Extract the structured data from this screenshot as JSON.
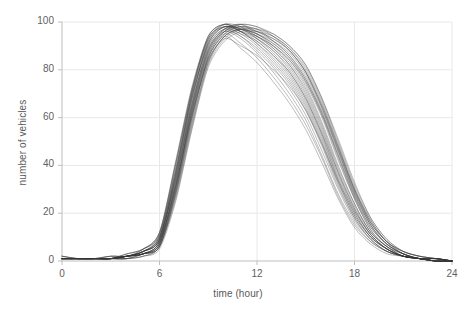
{
  "chart_data": {
    "type": "line",
    "title": "",
    "subtitle": "",
    "xlabel": "time (hour)",
    "ylabel": "number of vehicles",
    "xlim": [
      0,
      24
    ],
    "ylim": [
      0,
      100
    ],
    "xticks": [
      0,
      6,
      12,
      18,
      24
    ],
    "yticks": [
      0,
      20,
      40,
      60,
      80,
      100
    ],
    "xtick_labels": [
      "0",
      "6",
      "12",
      "18",
      "24"
    ],
    "ytick_labels": [
      "0",
      "20",
      "40",
      "60",
      "80",
      "100"
    ],
    "grid": true,
    "grid_color": "#e8e8e8",
    "axis_color": "#bfbfbf",
    "line_color": "#333333",
    "line_width": 0.6,
    "line_opacity": 0.55,
    "legend": null,
    "legend_position": "none",
    "annotations": [],
    "x": [
      0,
      1,
      2,
      3,
      4,
      5,
      6,
      7,
      8,
      9,
      10,
      11,
      12,
      13,
      14,
      15,
      16,
      17,
      18,
      19,
      20,
      21,
      22,
      23,
      24
    ],
    "series": [
      {
        "name": "day-01",
        "values": [
          1,
          1,
          1,
          1,
          2,
          3,
          7,
          33,
          64,
          88,
          97,
          99,
          96,
          93,
          88,
          79,
          64,
          46,
          28,
          15,
          7,
          3,
          1,
          1,
          0
        ]
      },
      {
        "name": "day-02",
        "values": [
          1,
          1,
          1,
          1,
          2,
          4,
          9,
          36,
          68,
          91,
          98,
          97,
          95,
          90,
          83,
          73,
          58,
          40,
          24,
          12,
          6,
          2,
          1,
          0,
          0
        ]
      },
      {
        "name": "day-03",
        "values": [
          1,
          1,
          1,
          1,
          1,
          3,
          6,
          29,
          60,
          85,
          95,
          98,
          97,
          94,
          89,
          80,
          66,
          48,
          30,
          16,
          8,
          3,
          1,
          1,
          0
        ]
      },
      {
        "name": "day-04",
        "values": [
          2,
          1,
          1,
          1,
          2,
          4,
          10,
          38,
          70,
          92,
          99,
          96,
          93,
          88,
          81,
          70,
          55,
          37,
          22,
          11,
          5,
          2,
          1,
          0,
          0
        ]
      },
      {
        "name": "day-05",
        "values": [
          1,
          1,
          1,
          1,
          2,
          3,
          8,
          31,
          62,
          86,
          96,
          99,
          98,
          95,
          90,
          82,
          68,
          50,
          32,
          18,
          9,
          4,
          2,
          1,
          0
        ]
      },
      {
        "name": "day-06",
        "values": [
          1,
          1,
          1,
          2,
          2,
          5,
          12,
          41,
          72,
          93,
          98,
          95,
          92,
          86,
          78,
          67,
          52,
          34,
          20,
          10,
          5,
          2,
          1,
          0,
          0
        ]
      },
      {
        "name": "day-07",
        "values": [
          1,
          1,
          1,
          1,
          1,
          2,
          6,
          27,
          57,
          83,
          94,
          97,
          96,
          93,
          88,
          79,
          65,
          47,
          29,
          15,
          7,
          3,
          1,
          1,
          0
        ]
      },
      {
        "name": "day-08",
        "values": [
          1,
          1,
          1,
          1,
          2,
          4,
          9,
          35,
          66,
          89,
          97,
          98,
          94,
          89,
          82,
          71,
          56,
          38,
          23,
          12,
          6,
          2,
          1,
          0,
          0
        ]
      },
      {
        "name": "day-09",
        "values": [
          1,
          1,
          1,
          1,
          2,
          3,
          7,
          30,
          61,
          84,
          93,
          90,
          86,
          80,
          73,
          63,
          49,
          33,
          19,
          10,
          5,
          2,
          1,
          0,
          0
        ]
      },
      {
        "name": "day-10",
        "values": [
          2,
          1,
          1,
          1,
          3,
          5,
          11,
          39,
          71,
          94,
          99,
          97,
          94,
          90,
          84,
          74,
          60,
          42,
          26,
          13,
          6,
          3,
          1,
          1,
          0
        ]
      },
      {
        "name": "day-11",
        "values": [
          1,
          1,
          1,
          1,
          2,
          3,
          8,
          32,
          63,
          87,
          96,
          94,
          88,
          81,
          72,
          61,
          46,
          30,
          17,
          9,
          4,
          2,
          1,
          0,
          0
        ]
      },
      {
        "name": "day-12",
        "values": [
          1,
          1,
          1,
          1,
          1,
          3,
          6,
          28,
          59,
          85,
          95,
          98,
          97,
          92,
          86,
          76,
          62,
          44,
          27,
          14,
          7,
          3,
          1,
          1,
          0
        ]
      },
      {
        "name": "day-13",
        "values": [
          1,
          1,
          1,
          2,
          2,
          4,
          10,
          37,
          69,
          91,
          98,
          96,
          91,
          84,
          76,
          65,
          50,
          33,
          19,
          10,
          5,
          2,
          1,
          0,
          0
        ]
      },
      {
        "name": "day-14",
        "values": [
          1,
          1,
          1,
          1,
          2,
          3,
          7,
          31,
          64,
          88,
          97,
          99,
          95,
          91,
          85,
          75,
          61,
          43,
          26,
          13,
          6,
          3,
          1,
          1,
          0
        ]
      },
      {
        "name": "day-15",
        "values": [
          1,
          1,
          1,
          1,
          2,
          4,
          9,
          34,
          65,
          90,
          97,
          95,
          90,
          83,
          75,
          64,
          49,
          32,
          18,
          9,
          4,
          2,
          1,
          0,
          0
        ]
      },
      {
        "name": "day-16",
        "values": [
          1,
          1,
          1,
          1,
          1,
          2,
          5,
          25,
          55,
          81,
          92,
          96,
          96,
          94,
          89,
          81,
          67,
          49,
          31,
          17,
          8,
          4,
          2,
          1,
          0
        ]
      },
      {
        "name": "day-17",
        "values": [
          2,
          1,
          1,
          1,
          3,
          5,
          12,
          42,
          73,
          94,
          99,
          96,
          92,
          86,
          79,
          68,
          53,
          35,
          21,
          11,
          5,
          2,
          1,
          0,
          0
        ]
      },
      {
        "name": "day-18",
        "values": [
          1,
          1,
          1,
          1,
          2,
          3,
          8,
          33,
          66,
          89,
          96,
          93,
          87,
          79,
          70,
          59,
          44,
          28,
          16,
          8,
          4,
          2,
          1,
          0,
          0
        ]
      },
      {
        "name": "day-19",
        "values": [
          1,
          1,
          1,
          1,
          2,
          4,
          9,
          36,
          68,
          92,
          98,
          97,
          94,
          89,
          82,
          72,
          57,
          39,
          24,
          12,
          6,
          2,
          1,
          1,
          0
        ]
      },
      {
        "name": "day-20",
        "values": [
          1,
          1,
          1,
          1,
          1,
          3,
          7,
          29,
          60,
          84,
          94,
          97,
          95,
          91,
          85,
          76,
          62,
          45,
          28,
          15,
          7,
          3,
          1,
          1,
          0
        ]
      },
      {
        "name": "day-21",
        "values": [
          1,
          1,
          1,
          2,
          2,
          4,
          11,
          40,
          71,
          93,
          99,
          98,
          93,
          87,
          79,
          68,
          53,
          36,
          21,
          11,
          5,
          2,
          1,
          0,
          0
        ]
      },
      {
        "name": "day-22",
        "values": [
          1,
          1,
          1,
          1,
          2,
          3,
          8,
          32,
          62,
          86,
          95,
          91,
          85,
          77,
          68,
          57,
          43,
          27,
          15,
          8,
          4,
          2,
          1,
          0,
          0
        ]
      },
      {
        "name": "day-23",
        "values": [
          1,
          1,
          1,
          1,
          2,
          4,
          10,
          37,
          70,
          93,
          98,
          96,
          94,
          90,
          84,
          75,
          61,
          44,
          27,
          14,
          7,
          3,
          1,
          1,
          0
        ]
      },
      {
        "name": "day-24",
        "values": [
          1,
          1,
          1,
          1,
          1,
          2,
          6,
          26,
          56,
          82,
          93,
          97,
          97,
          95,
          90,
          82,
          68,
          51,
          33,
          18,
          9,
          4,
          2,
          1,
          0
        ]
      },
      {
        "name": "day-25",
        "values": [
          2,
          1,
          1,
          1,
          3,
          5,
          11,
          38,
          69,
          90,
          97,
          94,
          89,
          82,
          74,
          63,
          48,
          31,
          18,
          9,
          4,
          2,
          1,
          0,
          0
        ]
      },
      {
        "name": "day-26",
        "values": [
          1,
          1,
          1,
          1,
          2,
          3,
          7,
          30,
          63,
          87,
          96,
          98,
          96,
          92,
          86,
          77,
          63,
          46,
          29,
          16,
          8,
          3,
          1,
          1,
          0
        ]
      },
      {
        "name": "day-27",
        "values": [
          1,
          1,
          1,
          1,
          2,
          4,
          9,
          35,
          67,
          91,
          98,
          96,
          91,
          85,
          77,
          66,
          51,
          34,
          20,
          10,
          5,
          2,
          1,
          0,
          0
        ]
      },
      {
        "name": "day-28",
        "values": [
          1,
          1,
          1,
          1,
          2,
          3,
          6,
          28,
          58,
          83,
          94,
          97,
          95,
          92,
          87,
          78,
          64,
          47,
          30,
          16,
          8,
          4,
          2,
          1,
          0
        ]
      },
      {
        "name": "day-29",
        "values": [
          1,
          1,
          1,
          2,
          2,
          5,
          12,
          41,
          72,
          94,
          99,
          97,
          93,
          88,
          80,
          69,
          54,
          37,
          22,
          11,
          5,
          2,
          1,
          0,
          0
        ]
      },
      {
        "name": "day-30",
        "values": [
          1,
          1,
          1,
          1,
          2,
          3,
          8,
          31,
          61,
          85,
          94,
          89,
          83,
          75,
          66,
          55,
          41,
          26,
          14,
          7,
          3,
          2,
          1,
          0,
          0
        ]
      },
      {
        "name": "day-31",
        "values": [
          1,
          1,
          1,
          1,
          2,
          4,
          10,
          34,
          65,
          88,
          96,
          99,
          98,
          94,
          88,
          79,
          65,
          48,
          30,
          17,
          8,
          4,
          2,
          1,
          0
        ]
      }
    ]
  },
  "plot_area": {
    "left": 62,
    "top": 22,
    "right": 452,
    "bottom": 261
  }
}
